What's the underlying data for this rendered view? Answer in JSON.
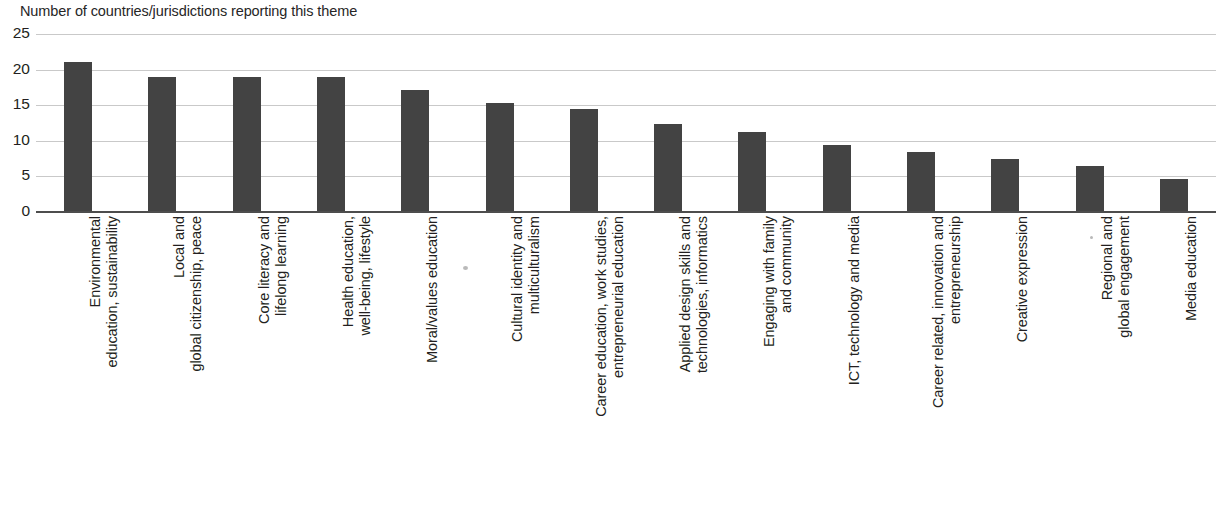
{
  "chart_data": {
    "type": "bar",
    "title": "Number of countries/jurisdictions reporting this theme",
    "xlabel": "",
    "ylabel": "",
    "ylim": [
      0,
      25
    ],
    "yticks": [
      0,
      5,
      10,
      15,
      20,
      25
    ],
    "grid": true,
    "legend": "none",
    "orientation": "vertical",
    "bar_color": "#434343",
    "gridline_color": "#c9c9c9",
    "axis_color": "#4d4d4d",
    "categories": [
      "Environmental\neducation, sustainability",
      "Local and\nglobal citizenship, peace",
      "Core literacy and\nlifelong learning",
      "Health education,\nwell-being, lifestyle",
      "Moral/values education",
      "Cultural identity and\nmulticulturalism",
      "Career education, work studies,\nentrepreneurial education",
      "Applied design skills and\ntechnologies, informatics",
      "Engaging with family\nand community",
      "ICT, technology and media",
      "Career related, innovation and\nentrepreneurship",
      "Creative expression",
      "Regional and\nglobal engagement",
      "Media education"
    ],
    "values": [
      21,
      19,
      19,
      19,
      17.2,
      15.3,
      14.5,
      12.3,
      11.3,
      9.4,
      8.4,
      7.5,
      6.5,
      4.6
    ]
  }
}
